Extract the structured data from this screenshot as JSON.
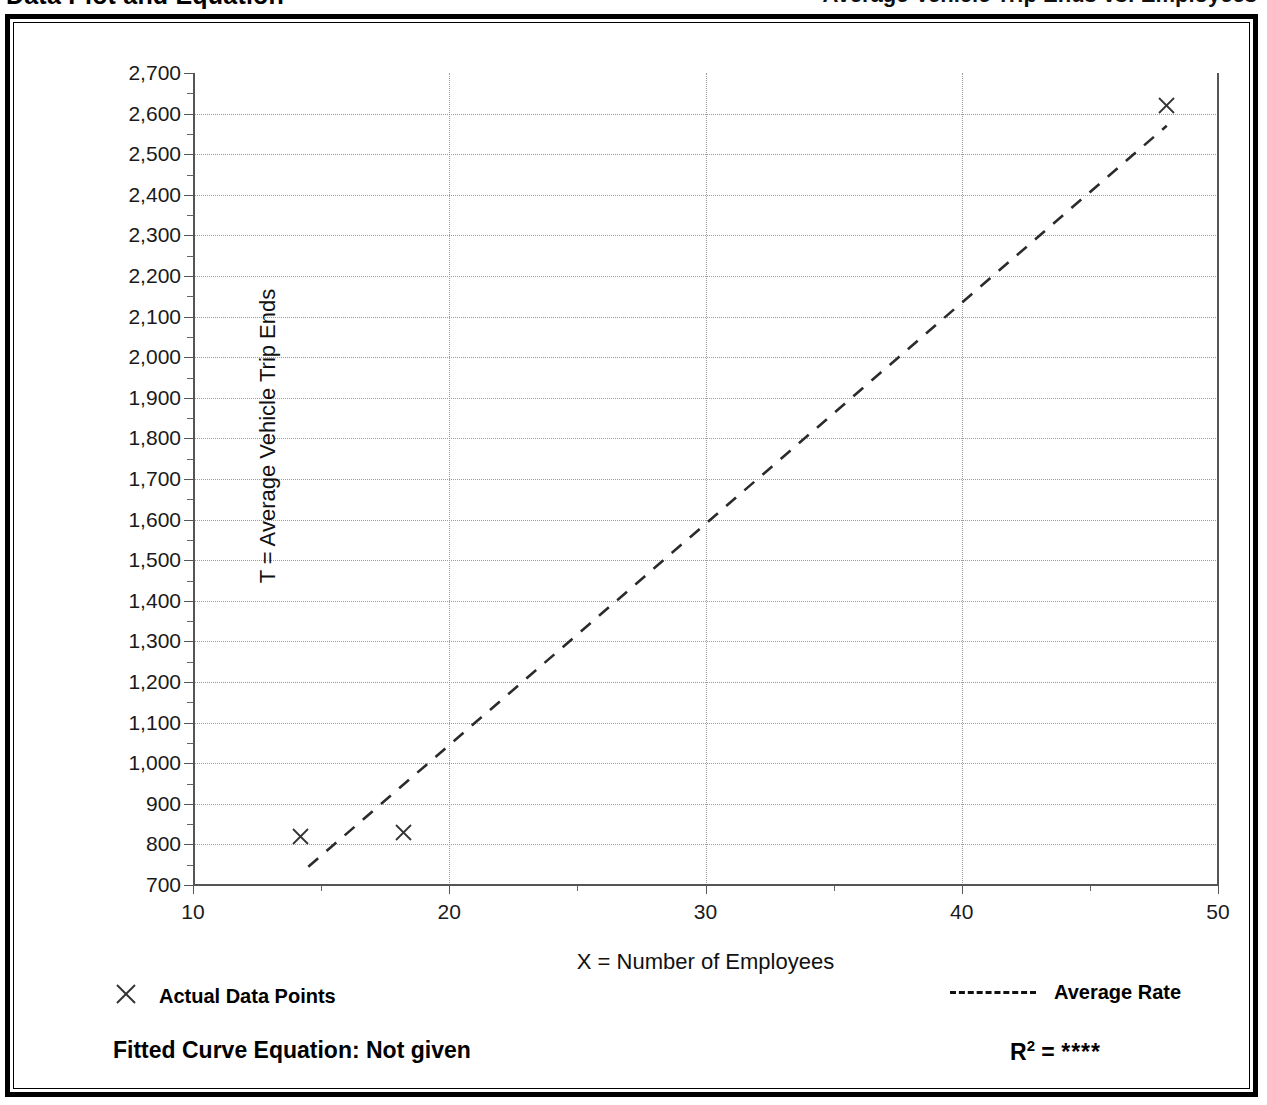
{
  "header": {
    "title": "Data Plot and Equation",
    "right_text": "Average Vehicle Trip Ends vs: Employees"
  },
  "legend": {
    "actual_label": "Actual Data Points",
    "actual_marker": "x-marker-icon",
    "average_label": "Average Rate",
    "average_marker": "dashed-line-icon"
  },
  "equation": {
    "fitted_label": "Fitted Curve Equation:  Not given",
    "r2_label": "R",
    "r2_exponent": "2",
    "r2_equals": " = ",
    "r2_value": "****"
  },
  "chart_data": {
    "type": "scatter",
    "title": "Data Plot and Equation",
    "xlabel": "X = Number of Employees",
    "ylabel": "T = Average Vehicle Trip Ends",
    "xlim": [
      10,
      50
    ],
    "ylim": [
      700,
      2700
    ],
    "xticks": [
      10,
      20,
      30,
      40,
      50
    ],
    "xtick_labels": [
      "10",
      "20",
      "30",
      "40",
      "50"
    ],
    "xminor_ticks": [
      15,
      25,
      35,
      45
    ],
    "yticks": [
      700,
      800,
      900,
      1000,
      1100,
      1200,
      1300,
      1400,
      1500,
      1600,
      1700,
      1800,
      1900,
      2000,
      2100,
      2200,
      2300,
      2400,
      2500,
      2600,
      2700
    ],
    "ytick_labels": [
      "700",
      "800",
      "900",
      "1,000",
      "1,100",
      "1,200",
      "1,300",
      "1,400",
      "1,500",
      "1,600",
      "1,700",
      "1,800",
      "1,900",
      "2,000",
      "2,100",
      "2,200",
      "2,300",
      "2,400",
      "2,500",
      "2,600",
      "2,700"
    ],
    "yminor_ticks": [
      750,
      850,
      950,
      1050,
      1150,
      1250,
      1350,
      1450,
      1550,
      1650,
      1750,
      1850,
      1950,
      2050,
      2150,
      2250,
      2350,
      2450,
      2550,
      2650
    ],
    "grid": true,
    "grid_style": "dotted",
    "legend_position": "below-axis",
    "series": [
      {
        "name": "Actual Data Points",
        "type": "scatter",
        "marker": "x",
        "points": [
          {
            "x": 14.2,
            "y": 820
          },
          {
            "x": 18.2,
            "y": 830
          },
          {
            "x": 48.0,
            "y": 2620
          }
        ]
      },
      {
        "name": "Average Rate",
        "type": "line",
        "style": "dashed",
        "points": [
          {
            "x": 14.5,
            "y": 745
          },
          {
            "x": 48.0,
            "y": 2570
          }
        ]
      }
    ]
  }
}
